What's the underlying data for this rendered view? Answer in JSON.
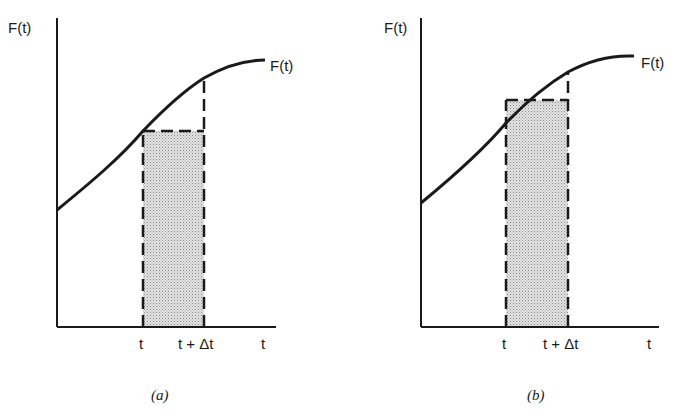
{
  "panels": [
    {
      "id": "a",
      "caption": "(a)",
      "y_axis_label": "F(t)",
      "curve_label": "F(t)",
      "x_axis_label": "t",
      "tick_t": "t",
      "tick_t_dt": "t + Δt",
      "rectangle_height_at": "F(t) (left endpoint, lower sum)"
    },
    {
      "id": "b",
      "caption": "(b)",
      "y_axis_label": "F(t)",
      "curve_label": "F(t)",
      "x_axis_label": "t",
      "tick_t": "t",
      "tick_t_dt": "t + Δt",
      "rectangle_height_at": "intermediate value between F(t) and F(t + Δt)"
    }
  ],
  "colors": {
    "ink": "#1a1a1a",
    "fill": "#d8d8d8",
    "background": "#ffffff"
  }
}
